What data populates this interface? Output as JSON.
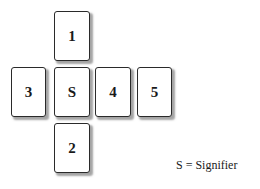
{
  "diagram": {
    "background_color": "#ffffff",
    "card_face_color": "#ffffff",
    "card_border_color": "#2a2a2a",
    "label_color": "#1a1a1a",
    "shadow_color": "#5a5a5a",
    "cards": [
      {
        "id": "card-1",
        "label": "1",
        "position": "top",
        "x": 54,
        "y": 11,
        "width": 36,
        "height": 50
      },
      {
        "id": "card-3",
        "label": "3",
        "position": "left",
        "x": 11,
        "y": 67,
        "width": 35,
        "height": 50
      },
      {
        "id": "card-s",
        "label": "S",
        "position": "center",
        "x": 54,
        "y": 67,
        "width": 36,
        "height": 50
      },
      {
        "id": "card-4",
        "label": "4",
        "position": "right-inner",
        "x": 95,
        "y": 67,
        "width": 36,
        "height": 50
      },
      {
        "id": "card-5",
        "label": "5",
        "position": "right-outer",
        "x": 137,
        "y": 67,
        "width": 35,
        "height": 50
      },
      {
        "id": "card-2",
        "label": "2",
        "position": "bottom",
        "x": 54,
        "y": 123,
        "width": 36,
        "height": 50
      }
    ],
    "legend": {
      "text": "S = Signifier",
      "x": 176,
      "y": 159
    }
  }
}
